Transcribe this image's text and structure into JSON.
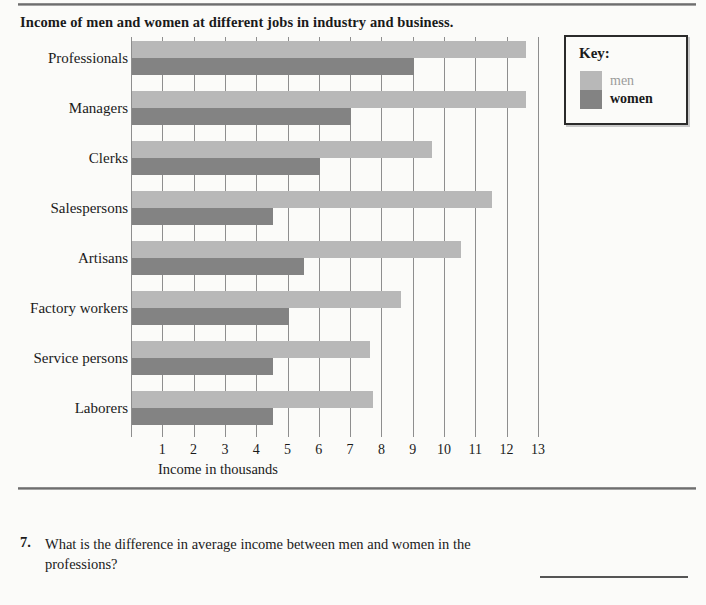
{
  "worksheet": {
    "title": "Income of men and women at different jobs in industry and business.",
    "question_number": "7.",
    "question_text": "What is the difference in average income between men and women in the professions?"
  },
  "key": {
    "heading": "Key:",
    "entries": [
      {
        "label": "men",
        "color": "#b8b8b8"
      },
      {
        "label": "women",
        "color": "#838383"
      }
    ]
  },
  "chart_data": {
    "type": "bar",
    "orientation": "horizontal",
    "title": "Income of men and women at different jobs in industry and business.",
    "xlabel": "Income in thousands",
    "ylabel": "",
    "xlim": [
      0,
      13
    ],
    "xticks": [
      1,
      2,
      3,
      4,
      5,
      6,
      7,
      8,
      9,
      10,
      11,
      12,
      13
    ],
    "xtick_labels": [
      "1",
      "2",
      "3",
      "4",
      "5",
      "6",
      "7",
      "8",
      "9",
      "10",
      "11",
      "12",
      "13"
    ],
    "grid": true,
    "grid_axis": "x",
    "legend": "Key:",
    "legend_position": "right",
    "categories": [
      "Professionals",
      "Managers",
      "Clerks",
      "Salespersons",
      "Artisans",
      "Factory workers",
      "Service persons",
      "Laborers"
    ],
    "series": [
      {
        "name": "men",
        "color": "#b8b8b8",
        "values": [
          12.6,
          12.6,
          9.6,
          11.5,
          10.5,
          8.6,
          7.6,
          7.7
        ]
      },
      {
        "name": "women",
        "color": "#838383",
        "values": [
          9.0,
          7.0,
          6.0,
          4.5,
          5.5,
          5.0,
          4.5,
          4.5
        ]
      }
    ]
  }
}
